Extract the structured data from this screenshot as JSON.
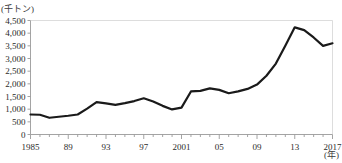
{
  "chart_data": {
    "type": "line",
    "title": "",
    "subtitle": "",
    "xlabel": "(年)",
    "ylabel": "(千トン)",
    "ylim": [
      0,
      4500
    ],
    "xlim": [
      1985,
      2017
    ],
    "grid": false,
    "legend": null,
    "y_ticks": [
      "0",
      "500",
      "1,000",
      "1,500",
      "2,000",
      "2,500",
      "3,000",
      "3,500",
      "4,000",
      "4,500"
    ],
    "y_tick_values": [
      0,
      500,
      1000,
      1500,
      2000,
      2500,
      3000,
      3500,
      4000,
      4500
    ],
    "x_ticks": [
      "1985",
      "89",
      "93",
      "97",
      "2001",
      "05",
      "09",
      "13",
      "2017"
    ],
    "x_tick_values": [
      1985,
      1989,
      1993,
      1997,
      2001,
      2005,
      2009,
      2013,
      2017
    ],
    "x": [
      1985,
      1986,
      1987,
      1988,
      1989,
      1990,
      1991,
      1992,
      1993,
      1994,
      1995,
      1996,
      1997,
      1998,
      1999,
      2000,
      2001,
      2002,
      2003,
      2004,
      2005,
      2006,
      2007,
      2008,
      2009,
      2010,
      2011,
      2012,
      2013,
      2014,
      2015,
      2016,
      2017
    ],
    "values": [
      790,
      780,
      660,
      700,
      740,
      790,
      1020,
      1280,
      1230,
      1170,
      1240,
      1320,
      1430,
      1300,
      1130,
      990,
      1060,
      1700,
      1720,
      1820,
      1760,
      1630,
      1700,
      1800,
      1970,
      2320,
      2800,
      3500,
      4230,
      4120,
      3830,
      3500,
      3600
    ],
    "series_color": "#1a1a1a",
    "axis_color": "#9a9a9a",
    "line_width": 2.2
  }
}
